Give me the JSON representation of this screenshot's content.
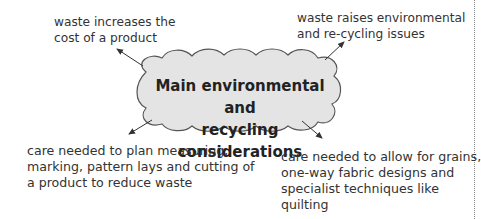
{
  "diagram": {
    "center": {
      "line1": "Main environmental and",
      "line2": "recycling considerations",
      "fill": "#e4e4e4",
      "stroke": "#555555"
    },
    "nodes": [
      {
        "id": "top-left",
        "lines": [
          "waste increases the",
          "cost of a product"
        ]
      },
      {
        "id": "top-right",
        "lines": [
          "waste raises environmental",
          "and re-cycling issues"
        ]
      },
      {
        "id": "bottom-left",
        "lines": [
          "care needed to plan measuring,",
          "marking, pattern lays and cutting of",
          "a product to reduce waste"
        ]
      },
      {
        "id": "bottom-right",
        "lines": [
          "care needed to allow for grains,",
          "one-way fabric designs and",
          "specialist techniques like",
          "quilting"
        ]
      }
    ]
  }
}
